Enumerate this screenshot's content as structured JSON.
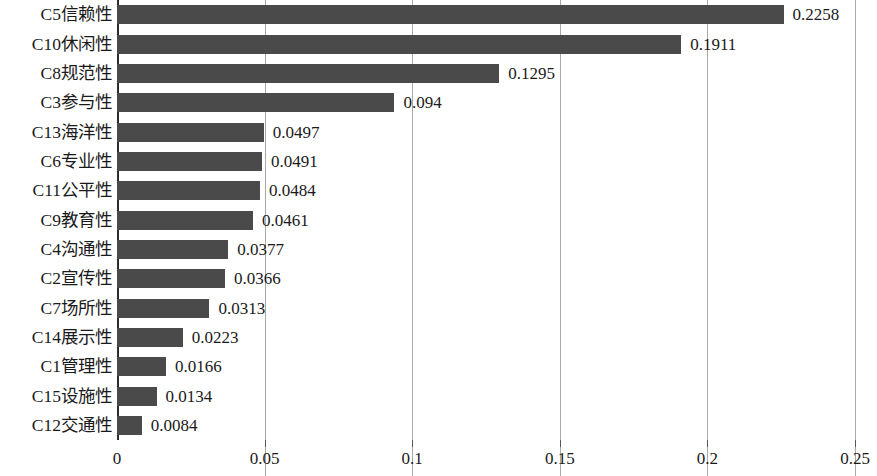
{
  "chart_data": {
    "type": "bar",
    "orientation": "horizontal",
    "title": "",
    "xlabel": "",
    "ylabel": "",
    "xlim": [
      0,
      0.25
    ],
    "xticks": [
      "0",
      "0.05",
      "0.1",
      "0.15",
      "0.2",
      "0.25"
    ],
    "xtick_values": [
      0,
      0.05,
      0.1,
      0.15,
      0.2,
      0.25
    ],
    "grid": "vertical",
    "legend": "none",
    "bar_color": "#4a4a4a",
    "gridline_color": "#a8a8a8",
    "axis_color": "#2b2b2b",
    "categories": [
      "C5信赖性",
      "C10休闲性",
      "C8规范性",
      "C3参与性",
      "C13海洋性",
      "C6专业性",
      "C11公平性",
      "C9教育性",
      "C4沟通性",
      "C2宣传性",
      "C7场所性",
      "C14展示性",
      "C1管理性",
      "C15设施性",
      "C12交通性"
    ],
    "values": [
      0.2258,
      0.1911,
      0.1295,
      0.094,
      0.0497,
      0.0491,
      0.0484,
      0.0461,
      0.0377,
      0.0366,
      0.0313,
      0.0223,
      0.0166,
      0.0134,
      0.0084
    ],
    "value_labels": [
      "0.2258",
      "0.1911",
      "0.1295",
      "0.094",
      "0.0497",
      "0.0491",
      "0.0484",
      "0.0461",
      "0.0377",
      "0.0366",
      "0.0313",
      "0.0223",
      "0.0166",
      "0.0134",
      "0.0084"
    ]
  }
}
